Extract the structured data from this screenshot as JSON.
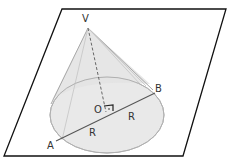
{
  "diagram": {
    "labels": {
      "vertex": "V",
      "center": "O",
      "point_a": "A",
      "point_b": "B",
      "radius_1": "R",
      "radius_2": "R"
    },
    "colors": {
      "plane_stroke": "#111111",
      "cone_fill": "#e6e6e6",
      "cone_stroke": "#a8a8a8",
      "base_fill": "#e9e9e9",
      "diameter_stroke": "#555555"
    }
  }
}
